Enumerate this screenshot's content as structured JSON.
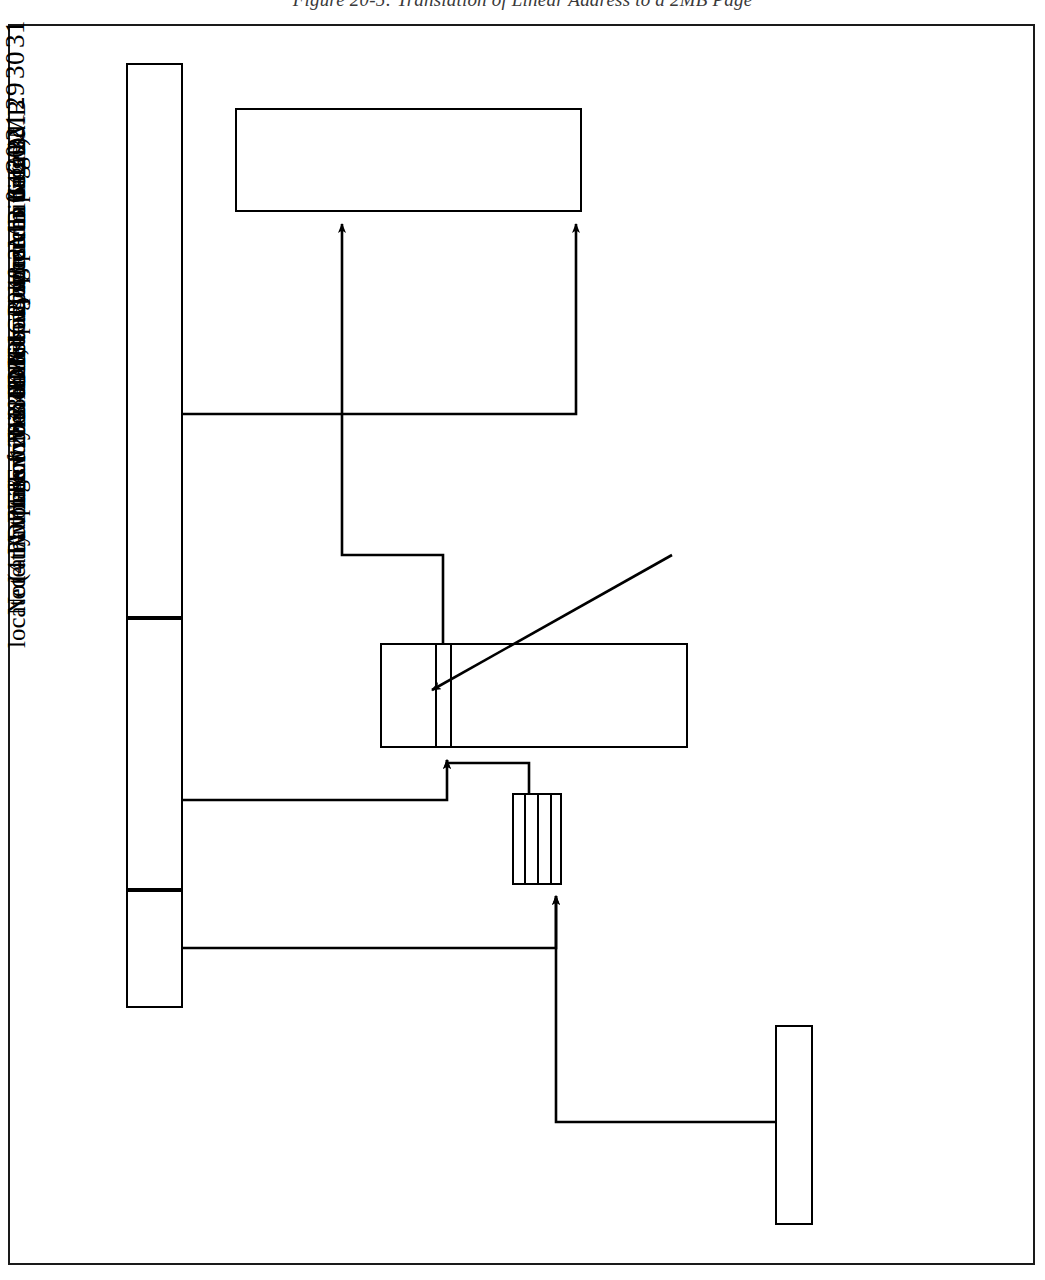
{
  "figure": {
    "caption": "Figure 20-5: Translation of Linear Address to a 2MB Page",
    "title": "Linear Address Translation to a 2MB page"
  },
  "linear_address": {
    "bit_labels": {
      "b31": "31",
      "b30": "30",
      "b29": "29",
      "b21": "21",
      "b20": "20",
      "b0": "0"
    },
    "fields": [
      {
        "name": "pdpt-index",
        "line1": "PDPT",
        "line2": "index",
        "bits": "31:30"
      },
      {
        "name": "page-directory-index",
        "line1": "Index into Page Directory",
        "line2": "(1-of-512)",
        "bits": "29:21"
      },
      {
        "name": "page-offset",
        "line1": "Index into 2MB page",
        "line2": "",
        "bits": "20:0"
      }
    ]
  },
  "structures": {
    "page_2mb": {
      "label": "2MB Page"
    },
    "page_directory": {
      "label_line1": "Page Directory",
      "label_line2": "(up to 512 entries)"
    },
    "pdpt": {
      "label_line1": "PDPT",
      "label_line2": "(up to 4 entries)"
    },
    "cr3": {
      "label": "CR3"
    }
  },
  "annotations": {
    "entry_callout": {
      "line1": "Entry is 64-bits wide, permitting 2MB",
      "line2": "page to be located anywhere in 64GB"
    },
    "note": {
      "line1": "A total of 2048 2MB pages can be defined",
      "line2": "(4 PDPTEs * 512 PDEs = 2048 2MB pages).",
      "line3": "Note that this covers 4GB, but pages can be",
      "line4": "located anywhere within the 64GB space."
    }
  },
  "colors": {
    "ink": "#000000",
    "paper": "#ffffff",
    "caption_ink": "#3a3a3a"
  }
}
